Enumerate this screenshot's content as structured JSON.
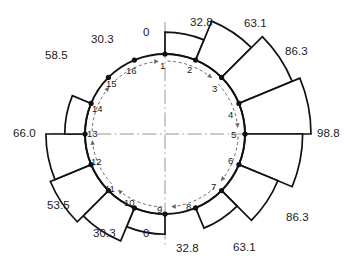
{
  "figure": {
    "type": "polar-sector-bar-diagram",
    "center": {
      "x": 165,
      "y": 134
    },
    "base_radius": 80,
    "sector_count": 16,
    "max_value": 98.8,
    "max_bar_px": 66
  },
  "chart_data": {
    "type": "bar",
    "title": "",
    "xlabel": "",
    "ylabel": "",
    "categories": [
      "1",
      "2",
      "3",
      "4",
      "5",
      "6",
      "7",
      "8",
      "9",
      "10",
      "11",
      "12",
      "13",
      "14",
      "15",
      "16"
    ],
    "values": [
      32.8,
      63.1,
      86.3,
      98.8,
      86.3,
      63.1,
      32.8,
      0,
      30.3,
      53.5,
      66.0,
      58.5,
      30.3,
      0,
      0,
      0
    ],
    "value_labels": [
      "32.8",
      "63.1",
      "86.3",
      "98.8",
      "86.3",
      "63.1",
      "32.8",
      "0",
      "30.3",
      "53.5",
      "66.0",
      "58.5",
      "30.3",
      "0"
    ],
    "ylim": [
      0,
      98.8
    ],
    "grid": false,
    "legend": null
  },
  "sectors": [
    {
      "id": 1,
      "from_node": 1,
      "to_node": 2,
      "a0": -90,
      "a1": -67.5,
      "value": 32.8,
      "label": "32.8",
      "label_x": 190,
      "label_y": 17
    },
    {
      "id": 2,
      "from_node": 2,
      "to_node": 3,
      "a0": -67.5,
      "a1": -45,
      "value": 63.1,
      "label": "63.1",
      "label_x": 244,
      "label_y": 18
    },
    {
      "id": 3,
      "from_node": 3,
      "to_node": 4,
      "a0": -45,
      "a1": -22.5,
      "value": 86.3,
      "label": "86.3",
      "label_x": 285,
      "label_y": 46
    },
    {
      "id": 4,
      "from_node": 4,
      "to_node": 5,
      "a0": -22.5,
      "a1": 0,
      "value": 98.8,
      "label": "98.8",
      "label_x": 317,
      "label_y": 128
    },
    {
      "id": 5,
      "from_node": 5,
      "to_node": 6,
      "a0": 0,
      "a1": 22.5,
      "value": 86.3,
      "label": "86.3",
      "label_x": 286,
      "label_y": 212
    },
    {
      "id": 6,
      "from_node": 6,
      "to_node": 7,
      "a0": 22.5,
      "a1": 45,
      "value": 63.1,
      "label": "63.1",
      "label_x": 233,
      "label_y": 242
    },
    {
      "id": 7,
      "from_node": 7,
      "to_node": 8,
      "a0": 45,
      "a1": 67.5,
      "value": 32.8,
      "label": "32.8",
      "label_x": 176,
      "label_y": 243
    },
    {
      "id": 8,
      "from_node": 8,
      "to_node": 9,
      "a0": 67.5,
      "a1": 90,
      "value": 0,
      "label": "0",
      "label_x": 143,
      "label_y": 228
    },
    {
      "id": 9,
      "from_node": 9,
      "to_node": 10,
      "a0": 90,
      "a1": 112.5,
      "value": 30.3,
      "label": "30.3",
      "label_x": 93,
      "label_y": 228
    },
    {
      "id": 10,
      "from_node": 10,
      "to_node": 11,
      "a0": 112.5,
      "a1": 135,
      "value": 53.5,
      "label": "53.5",
      "label_x": 47,
      "label_y": 200
    },
    {
      "id": 11,
      "from_node": 11,
      "to_node": 12,
      "a0": 135,
      "a1": 157.5,
      "value": 66.0,
      "label": "66.0",
      "label_x": 13,
      "label_y": 128
    },
    {
      "id": 12,
      "from_node": 12,
      "to_node": 13,
      "a0": 157.5,
      "a1": 180,
      "value": 58.5,
      "label": "58.5",
      "label_x": 45,
      "label_y": 50
    },
    {
      "id": 13,
      "from_node": 13,
      "to_node": 14,
      "a0": 180,
      "a1": 202.5,
      "value": 30.3,
      "label": "30.3",
      "label_x": 91,
      "label_y": 34
    },
    {
      "id": 14,
      "from_node": 14,
      "to_node": 15,
      "a0": 202.5,
      "a1": 225,
      "value": 0,
      "label": "0",
      "label_x": 143,
      "label_y": 27
    }
  ],
  "nodes": [
    {
      "id": "1",
      "label": "1",
      "x": 160,
      "y": 61
    },
    {
      "id": "2",
      "label": "2",
      "x": 187,
      "y": 65
    },
    {
      "id": "3",
      "label": "3",
      "x": 212,
      "y": 84
    },
    {
      "id": "4",
      "label": "4",
      "x": 228,
      "y": 110
    },
    {
      "id": "5",
      "label": "5",
      "x": 231,
      "y": 130
    },
    {
      "id": "6",
      "label": "6",
      "x": 228,
      "y": 156
    },
    {
      "id": "7",
      "label": "7",
      "x": 211,
      "y": 182
    },
    {
      "id": "8",
      "label": "8",
      "x": 186,
      "y": 202
    },
    {
      "id": "9",
      "label": "9",
      "x": 157,
      "y": 205
    },
    {
      "id": "10",
      "label": "10",
      "x": 124,
      "y": 198
    },
    {
      "id": "11",
      "label": "11",
      "x": 105,
      "y": 184
    },
    {
      "id": "12",
      "label": "12",
      "x": 91,
      "y": 157
    },
    {
      "id": "13",
      "label": "13",
      "x": 87,
      "y": 129
    },
    {
      "id": "14",
      "label": "14",
      "x": 92,
      "y": 104
    },
    {
      "id": "15",
      "label": "15",
      "x": 106,
      "y": 79
    },
    {
      "id": "16",
      "label": "16",
      "x": 126,
      "y": 66
    }
  ],
  "style": {
    "line_color": "#111111",
    "axis_color": "#777777",
    "arrow_color": "#666666",
    "fill_color": "#ffffff",
    "background": "#ffffff"
  }
}
